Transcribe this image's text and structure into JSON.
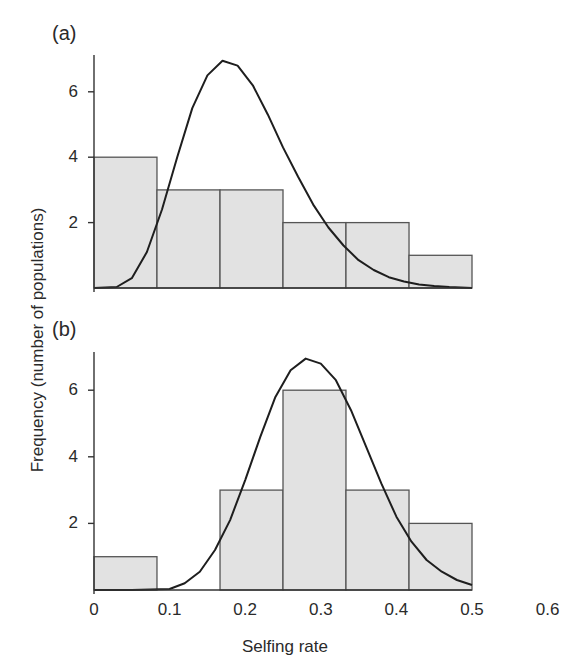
{
  "figure": {
    "ylabel": "Frequency (number of populations)",
    "xlabel": "Selfing rate",
    "x_ticks": [
      "0",
      "0.1",
      "0.2",
      "0.3",
      "0.4",
      "0.5",
      "0.6"
    ],
    "y_ticks": [
      "2",
      "4",
      "6"
    ],
    "colors": {
      "bar_fill": "#e2e2e2",
      "bar_edge": "#555555",
      "curve": "#1e1e1e",
      "axis": "#333333"
    }
  },
  "chart_data": [
    {
      "type": "bar",
      "panel": "(a)",
      "title": "(a)",
      "xlabel": "Selfing rate",
      "ylabel": "Frequency (number of populations)",
      "bin_edges": [
        0,
        0.0833,
        0.1667,
        0.25,
        0.3333,
        0.4167,
        0.5
      ],
      "categories": [
        "0-0.083",
        "0.083-0.167",
        "0.167-0.25",
        "0.25-0.333",
        "0.333-0.417",
        "0.417-0.5"
      ],
      "values": [
        4,
        3,
        3,
        2,
        2,
        1
      ],
      "overlay_curve": {
        "type": "line",
        "description": "fitted density curve",
        "x": [
          0.0,
          0.03,
          0.05,
          0.07,
          0.09,
          0.11,
          0.13,
          0.15,
          0.17,
          0.19,
          0.21,
          0.23,
          0.25,
          0.27,
          0.29,
          0.31,
          0.33,
          0.35,
          0.37,
          0.39,
          0.41,
          0.43,
          0.45,
          0.47,
          0.5
        ],
        "y": [
          0.0,
          0.03,
          0.3,
          1.1,
          2.4,
          4.0,
          5.5,
          6.5,
          6.95,
          6.8,
          6.2,
          5.3,
          4.3,
          3.4,
          2.55,
          1.85,
          1.3,
          0.85,
          0.55,
          0.33,
          0.2,
          0.11,
          0.06,
          0.03,
          0.0
        ],
        "peak": {
          "x": 0.175,
          "y": 6.95
        }
      },
      "xlim": [
        0,
        0.6
      ],
      "ylim": [
        0,
        7.2
      ],
      "grid": false
    },
    {
      "type": "bar",
      "panel": "(b)",
      "title": "(b)",
      "xlabel": "Selfing rate",
      "ylabel": "Frequency (number of populations)",
      "bin_edges": [
        0,
        0.0833,
        0.1667,
        0.25,
        0.3333,
        0.4167,
        0.5
      ],
      "categories": [
        "0-0.083",
        "0.083-0.167",
        "0.167-0.25",
        "0.25-0.333",
        "0.333-0.417",
        "0.417-0.5"
      ],
      "values": [
        1,
        0,
        3,
        6,
        3,
        2
      ],
      "overlay_curve": {
        "type": "line",
        "description": "fitted density curve",
        "x": [
          0.0,
          0.05,
          0.1,
          0.12,
          0.14,
          0.16,
          0.18,
          0.2,
          0.22,
          0.24,
          0.26,
          0.28,
          0.3,
          0.32,
          0.34,
          0.36,
          0.38,
          0.4,
          0.42,
          0.44,
          0.46,
          0.48,
          0.5
        ],
        "y": [
          0.0,
          0.0,
          0.03,
          0.2,
          0.55,
          1.2,
          2.1,
          3.3,
          4.6,
          5.8,
          6.6,
          6.95,
          6.8,
          6.3,
          5.4,
          4.3,
          3.2,
          2.2,
          1.45,
          0.9,
          0.55,
          0.3,
          0.15
        ],
        "peak": {
          "x": 0.28,
          "y": 6.95
        }
      },
      "xlim": [
        0,
        0.6
      ],
      "ylim": [
        0,
        7.2
      ],
      "grid": false
    }
  ]
}
